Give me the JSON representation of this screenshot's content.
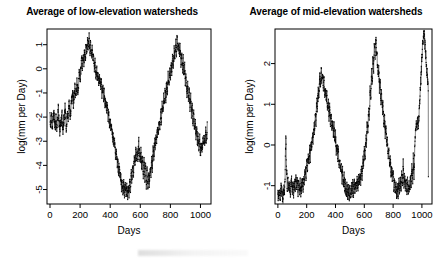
{
  "figure": {
    "width": 448,
    "height": 260,
    "background": "#ffffff",
    "foreground": "#000000"
  },
  "panels": [
    {
      "id": "low-elevation",
      "title": "Average of low-elevation watersheds",
      "xlabel": "Days",
      "ylabel": "log(mm per Day)"
    },
    {
      "id": "mid-elevation",
      "title": "Average of mid-elevation watersheds",
      "xlabel": "Days",
      "ylabel": "log(mm per Day)"
    }
  ],
  "chart_data": [
    {
      "type": "line",
      "panel": "low-elevation",
      "title": "Average of low-elevation watersheds",
      "xlabel": "Days",
      "ylabel": "log(mm per Day)",
      "xlim": [
        -20,
        1070
      ],
      "ylim": [
        -5.6,
        1.65
      ],
      "xticks": [
        0,
        200,
        400,
        600,
        800,
        1000
      ],
      "yticks": [
        1,
        0,
        -1,
        -2,
        -3,
        -4,
        -5
      ],
      "grid": false,
      "legend": null,
      "marker": "point",
      "series": [
        {
          "name": "low-elevation mean runoff",
          "x": [
            0,
            5,
            10,
            15,
            20,
            25,
            30,
            35,
            40,
            45,
            50,
            55,
            60,
            65,
            70,
            75,
            80,
            85,
            90,
            95,
            100,
            105,
            110,
            115,
            120,
            125,
            130,
            135,
            140,
            145,
            150,
            155,
            160,
            165,
            170,
            175,
            180,
            185,
            190,
            195,
            200,
            205,
            210,
            215,
            220,
            225,
            230,
            235,
            240,
            245,
            250,
            255,
            260,
            265,
            270,
            275,
            280,
            285,
            290,
            295,
            300,
            305,
            310,
            315,
            320,
            325,
            330,
            335,
            340,
            345,
            350,
            355,
            360,
            365,
            370,
            375,
            380,
            385,
            390,
            395,
            400,
            405,
            410,
            415,
            420,
            425,
            430,
            435,
            440,
            445,
            450,
            455,
            460,
            465,
            470,
            475,
            480,
            485,
            490,
            495,
            500,
            505,
            510,
            515,
            520,
            525,
            530,
            535,
            540,
            545,
            550,
            555,
            560,
            565,
            570,
            575,
            580,
            585,
            590,
            595,
            600,
            605,
            610,
            615,
            620,
            625,
            630,
            635,
            640,
            645,
            650,
            655,
            660,
            665,
            670,
            675,
            680,
            685,
            690,
            695,
            700,
            705,
            710,
            715,
            720,
            725,
            730,
            735,
            740,
            745,
            750,
            755,
            760,
            765,
            770,
            775,
            780,
            785,
            790,
            795,
            800,
            805,
            810,
            815,
            820,
            825,
            830,
            835,
            840,
            845,
            850,
            855,
            860,
            865,
            870,
            875,
            880,
            885,
            890,
            895,
            900,
            905,
            910,
            915,
            920,
            925,
            930,
            935,
            940,
            945,
            950,
            955,
            960,
            965,
            970,
            975,
            980,
            985,
            990,
            995,
            1000,
            1005,
            1010,
            1015,
            1020,
            1025,
            1030,
            1035,
            1040,
            1045
          ],
          "y": [
            -2.05,
            -2.35,
            -1.95,
            -2.4,
            -2.1,
            -1.75,
            -2.3,
            -2.5,
            -2.0,
            -2.45,
            -2.15,
            -1.6,
            -2.25,
            -2.55,
            -2.1,
            -2.3,
            -1.9,
            -2.6,
            -2.2,
            -2.05,
            -1.55,
            -2.25,
            -2.45,
            -1.8,
            -2.15,
            -1.4,
            -1.75,
            -2.05,
            -1.55,
            -1.3,
            -0.95,
            -1.45,
            -1.15,
            -0.7,
            -1.25,
            -0.95,
            -0.55,
            -1.0,
            -0.6,
            -0.15,
            -0.45,
            -0.05,
            0.35,
            0.15,
            0.55,
            0.3,
            0.75,
            0.45,
            1.0,
            0.65,
            1.25,
            0.85,
            1.3,
            0.7,
            1.05,
            0.45,
            0.8,
            0.3,
            0.55,
            0.05,
            0.25,
            -0.2,
            -0.05,
            -0.45,
            -0.25,
            -0.6,
            -0.4,
            -0.8,
            -0.55,
            -1.0,
            -0.75,
            -1.2,
            -1.05,
            -1.45,
            -1.3,
            -1.7,
            -1.55,
            -1.95,
            -1.85,
            -2.25,
            -2.15,
            -2.55,
            -2.45,
            -2.85,
            -2.8,
            -3.2,
            -3.1,
            -3.55,
            -3.45,
            -3.9,
            -3.8,
            -4.25,
            -4.1,
            -4.55,
            -4.4,
            -4.85,
            -4.65,
            -5.05,
            -4.8,
            -5.15,
            -4.9,
            -5.2,
            -4.95,
            -5.25,
            -5.0,
            -5.1,
            -4.7,
            -4.95,
            -4.35,
            -4.6,
            -4.0,
            -4.3,
            -3.7,
            -4.05,
            -3.45,
            -3.85,
            -3.3,
            -3.7,
            -3.05,
            -3.5,
            -3.85,
            -3.4,
            -4.1,
            -3.6,
            -4.35,
            -3.75,
            -4.55,
            -3.95,
            -4.8,
            -4.2,
            -5.0,
            -4.45,
            -4.75,
            -4.1,
            -4.45,
            -3.7,
            -4.05,
            -3.35,
            -3.65,
            -3.0,
            -3.3,
            -2.7,
            -3.0,
            -2.4,
            -2.7,
            -2.1,
            -2.4,
            -1.8,
            -2.1,
            -1.5,
            -1.8,
            -1.2,
            -1.5,
            -0.9,
            -1.2,
            -0.6,
            -0.9,
            -0.35,
            -0.65,
            -0.1,
            -0.4,
            0.2,
            -0.15,
            0.5,
            0.15,
            0.8,
            0.4,
            1.1,
            0.7,
            1.3,
            0.85,
            1.15,
            0.55,
            0.9,
            0.3,
            0.6,
            0.0,
            0.35,
            -0.3,
            0.05,
            -0.6,
            -0.25,
            -0.95,
            -0.55,
            -1.3,
            -0.9,
            -1.6,
            -1.2,
            -1.9,
            -1.5,
            -2.2,
            -1.8,
            -2.5,
            -2.15,
            -2.8,
            -2.45,
            -3.05,
            -2.7,
            -3.3,
            -2.95,
            -3.45,
            -3.1,
            -3.4,
            -2.95,
            -3.2,
            -2.8,
            -3.1,
            -2.65,
            -2.95,
            -2.55,
            -2.85,
            -2.45,
            -2.75,
            -2.35,
            -2.6,
            -2.2
          ]
        }
      ]
    },
    {
      "type": "line",
      "panel": "mid-elevation",
      "title": "Average of mid-elevation watersheds",
      "xlabel": "Days",
      "ylabel": "log(mm per Day)",
      "xlim": [
        -20,
        1070
      ],
      "ylim": [
        -1.45,
        2.85
      ],
      "xticks": [
        0,
        200,
        400,
        600,
        800,
        1000
      ],
      "yticks": [
        2,
        1,
        0,
        -1
      ],
      "grid": false,
      "legend": null,
      "marker": "point",
      "series": [
        {
          "name": "mid-elevation mean runoff",
          "x": [
            0,
            5,
            10,
            15,
            20,
            25,
            30,
            35,
            40,
            45,
            50,
            55,
            60,
            65,
            70,
            75,
            80,
            85,
            90,
            95,
            100,
            105,
            110,
            115,
            120,
            125,
            130,
            135,
            140,
            145,
            150,
            155,
            160,
            165,
            170,
            175,
            180,
            185,
            190,
            195,
            200,
            205,
            210,
            215,
            220,
            225,
            230,
            235,
            240,
            245,
            250,
            255,
            260,
            265,
            270,
            275,
            280,
            285,
            290,
            295,
            300,
            305,
            310,
            315,
            320,
            325,
            330,
            335,
            340,
            345,
            350,
            355,
            360,
            365,
            370,
            375,
            380,
            385,
            390,
            395,
            400,
            405,
            410,
            415,
            420,
            425,
            430,
            435,
            440,
            445,
            450,
            455,
            460,
            465,
            470,
            475,
            480,
            485,
            490,
            495,
            500,
            505,
            510,
            515,
            520,
            525,
            530,
            535,
            540,
            545,
            550,
            555,
            560,
            565,
            570,
            575,
            580,
            585,
            590,
            595,
            600,
            605,
            610,
            615,
            620,
            625,
            630,
            635,
            640,
            645,
            650,
            655,
            660,
            665,
            670,
            675,
            680,
            685,
            690,
            695,
            700,
            705,
            710,
            715,
            720,
            725,
            730,
            735,
            740,
            745,
            750,
            755,
            760,
            765,
            770,
            775,
            780,
            785,
            790,
            795,
            800,
            805,
            810,
            815,
            820,
            825,
            830,
            835,
            840,
            845,
            850,
            855,
            860,
            865,
            870,
            875,
            880,
            885,
            890,
            895,
            900,
            905,
            910,
            915,
            920,
            925,
            930,
            935,
            940,
            945,
            950,
            955,
            960,
            965,
            970,
            975,
            980,
            985,
            990,
            995,
            1000,
            1005,
            1010,
            1015,
            1020,
            1025,
            1030,
            1035,
            1040,
            1045
          ],
          "y": [
            -1.2,
            -1.28,
            -1.1,
            -1.3,
            -1.15,
            -0.95,
            -1.25,
            -1.32,
            -1.05,
            -1.22,
            -0.78,
            0.18,
            -0.55,
            -1.05,
            -0.85,
            -1.18,
            -0.92,
            -1.25,
            -1.0,
            -0.8,
            -1.15,
            -0.95,
            -1.22,
            -0.88,
            -1.1,
            -0.75,
            -1.05,
            -0.9,
            -1.18,
            -0.85,
            -1.12,
            -0.95,
            -1.2,
            -1.0,
            -0.85,
            -1.05,
            -0.7,
            -0.9,
            -0.55,
            -0.75,
            -0.45,
            -0.6,
            -0.3,
            -0.48,
            -0.15,
            -0.32,
            0.05,
            -0.12,
            0.28,
            0.1,
            0.52,
            0.32,
            0.8,
            0.58,
            1.1,
            0.88,
            1.4,
            1.15,
            1.7,
            1.45,
            1.9,
            1.6,
            1.78,
            1.4,
            1.62,
            1.25,
            1.45,
            1.1,
            1.28,
            0.9,
            1.1,
            0.72,
            0.92,
            0.55,
            0.75,
            0.38,
            0.58,
            0.22,
            0.42,
            0.05,
            0.25,
            -0.12,
            0.08,
            -0.3,
            -0.1,
            -0.48,
            -0.28,
            -0.65,
            -0.45,
            -0.82,
            -0.62,
            -0.98,
            -0.8,
            -1.1,
            -0.95,
            -1.2,
            -1.02,
            -1.25,
            -1.08,
            -1.28,
            -1.1,
            -1.22,
            -1.05,
            -1.18,
            -0.98,
            -1.15,
            -0.95,
            -1.12,
            -0.92,
            -1.08,
            -0.88,
            -1.02,
            -0.82,
            -0.95,
            -0.7,
            -0.88,
            -0.55,
            -0.72,
            -0.35,
            -0.55,
            -0.1,
            -0.3,
            0.2,
            0.0,
            0.55,
            0.32,
            0.95,
            0.7,
            1.35,
            1.1,
            1.75,
            1.5,
            2.15,
            1.9,
            2.5,
            2.25,
            2.62,
            2.3,
            2.1,
            1.7,
            1.85,
            1.4,
            1.55,
            1.1,
            1.28,
            0.82,
            1.0,
            0.55,
            0.72,
            0.28,
            0.45,
            0.02,
            0.18,
            -0.25,
            -0.08,
            -0.5,
            -0.32,
            -0.72,
            -0.55,
            -0.9,
            -0.72,
            -1.05,
            -0.88,
            -1.15,
            -1.0,
            -1.22,
            -1.05,
            -1.18,
            -0.95,
            -1.12,
            -0.85,
            -1.08,
            -0.6,
            -1.02,
            -0.45,
            -0.98,
            -0.7,
            -1.1,
            -0.82,
            -1.15,
            -0.9,
            -1.18,
            -0.95,
            -1.1,
            -0.7,
            -1.05,
            -0.55,
            -0.95,
            -0.3,
            -0.75,
            0.0,
            0.3,
            0.55,
            0.42,
            0.65,
            0.5,
            0.8,
            1.1,
            1.45,
            1.8,
            2.15,
            2.45,
            2.68,
            2.72,
            2.5,
            2.3,
            2.05,
            1.8,
            1.55,
            1.28,
            1.02,
            0.78,
            0.52,
            0.28,
            0.05,
            -0.18,
            -0.38,
            -0.55,
            -0.68,
            -0.78
          ]
        }
      ]
    }
  ]
}
